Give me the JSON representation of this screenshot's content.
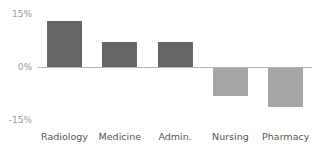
{
  "chart_data": {
    "type": "bar",
    "title": "",
    "xlabel": "",
    "ylabel": "",
    "categories": [
      "Radiology",
      "Medicine",
      "Admin.",
      "Nursing",
      "Pharmacy"
    ],
    "values": [
      13,
      7,
      7,
      -8,
      -11
    ],
    "unit": "%",
    "ylim": [
      -15,
      15
    ],
    "yticks": [
      "15%",
      "0%",
      "-15%"
    ],
    "grid": false,
    "legend": null,
    "colors": {
      "positive": "#666666",
      "negative": "#a6a6a6",
      "baseline": "#b5b5b5"
    }
  }
}
